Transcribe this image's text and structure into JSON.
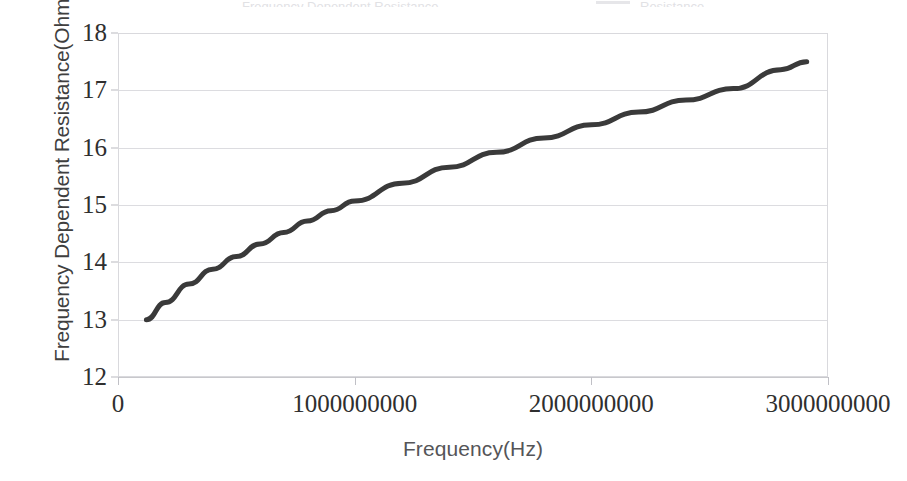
{
  "header": {
    "title_remnant": "Frequency Dependent Resistance",
    "legend_remnant": "Resistance",
    "swatch_color": "#d5d5da"
  },
  "chart_data": {
    "type": "line",
    "title": "",
    "xlabel": "Frequency(Hz)",
    "ylabel": "Frequency Dependent Resistance(Ohm)",
    "xlim": [
      0,
      3000000000
    ],
    "ylim": [
      12,
      18
    ],
    "grid": true,
    "legend_position": "none",
    "x_ticks": [
      0,
      1000000000,
      2000000000,
      3000000000
    ],
    "x_tick_labels": [
      "0",
      "1000000000",
      "2000000000",
      "3000000000"
    ],
    "y_ticks": [
      12,
      13,
      14,
      15,
      16,
      17,
      18
    ],
    "y_tick_labels": [
      "12",
      "13",
      "14",
      "15",
      "16",
      "17",
      "18"
    ],
    "series": [
      {
        "name": "Frequency Dependent Resistance",
        "color": "#3a3a3a",
        "line_width": 5,
        "x": [
          120000000,
          200000000,
          300000000,
          400000000,
          500000000,
          600000000,
          700000000,
          800000000,
          900000000,
          1000000000,
          1200000000,
          1400000000,
          1600000000,
          1800000000,
          2000000000,
          2200000000,
          2400000000,
          2600000000,
          2800000000,
          2910000000
        ],
        "y": [
          13.0,
          13.3,
          13.62,
          13.88,
          14.1,
          14.32,
          14.52,
          14.72,
          14.9,
          15.07,
          15.38,
          15.66,
          15.92,
          16.17,
          16.4,
          16.62,
          16.83,
          17.03,
          17.36,
          17.5
        ]
      }
    ]
  }
}
